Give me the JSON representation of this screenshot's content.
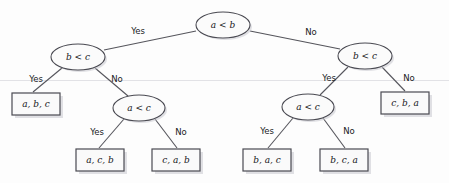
{
  "diagram": {
    "type": "decision-tree",
    "canvas": {
      "width": 449,
      "height": 183
    },
    "background_color": "#fdfdfd",
    "node_fill_color": "#fbfbfb",
    "node_stroke_color": "#4a4a52",
    "leaf_fill_color": "#fafafa",
    "edge_color": "#55555c",
    "text_color": "#17171a"
  },
  "nodes": {
    "root": {
      "label": "a < b",
      "cx": 223,
      "cy": 25,
      "rx": 27,
      "ry": 13
    },
    "left_bc": {
      "label": "b < c",
      "cx": 78,
      "cy": 57,
      "rx": 27,
      "ry": 13
    },
    "right_bc": {
      "label": "b < c",
      "cx": 365,
      "cy": 56,
      "rx": 27,
      "ry": 13
    },
    "left_ac": {
      "label": "a < c",
      "cx": 139,
      "cy": 108,
      "rx": 26,
      "ry": 13
    },
    "right_ac": {
      "label": "a < c",
      "cx": 308,
      "cy": 107,
      "rx": 26,
      "ry": 13
    }
  },
  "leaves": [
    {
      "id": "leaf-abc",
      "label": "a, b, c",
      "x": 12,
      "y": 93,
      "w": 48,
      "h": 22
    },
    {
      "id": "leaf-acb",
      "label": "a, c, b",
      "x": 76,
      "y": 149,
      "w": 48,
      "h": 22
    },
    {
      "id": "leaf-cab",
      "label": "c, a, b",
      "x": 152,
      "y": 149,
      "w": 48,
      "h": 22
    },
    {
      "id": "leaf-bac",
      "label": "b, a, c",
      "x": 243,
      "y": 149,
      "w": 48,
      "h": 22
    },
    {
      "id": "leaf-bca",
      "label": "b, c, a",
      "x": 320,
      "y": 149,
      "w": 48,
      "h": 22
    },
    {
      "id": "leaf-cba",
      "label": "c, b, a",
      "x": 381,
      "y": 92,
      "w": 48,
      "h": 22
    }
  ],
  "edge_labels": [
    {
      "id": "root-yes",
      "text": "Yes",
      "x": 138,
      "y": 31
    },
    {
      "id": "root-no",
      "text": "No",
      "x": 311,
      "y": 32
    },
    {
      "id": "left-bc-yes",
      "text": "Yes",
      "x": 36,
      "y": 79
    },
    {
      "id": "left-bc-no",
      "text": "No",
      "x": 117,
      "y": 79
    },
    {
      "id": "right-bc-yes",
      "text": "Yes",
      "x": 329,
      "y": 78
    },
    {
      "id": "right-bc-no",
      "text": "No",
      "x": 409,
      "y": 78
    },
    {
      "id": "left-ac-yes",
      "text": "Yes",
      "x": 97,
      "y": 132
    },
    {
      "id": "left-ac-no",
      "text": "No",
      "x": 181,
      "y": 132
    },
    {
      "id": "right-ac-yes",
      "text": "Yes",
      "x": 267,
      "y": 131
    },
    {
      "id": "right-ac-no",
      "text": "No",
      "x": 349,
      "y": 131
    }
  ],
  "edges": [
    {
      "id": "root-to-left-bc",
      "from": "root",
      "to": "left_bc",
      "branch": "Yes"
    },
    {
      "id": "root-to-right-bc",
      "from": "root",
      "to": "right_bc",
      "branch": "No"
    },
    {
      "id": "left-bc-to-abc",
      "from": "left_bc",
      "to": "leaf-abc",
      "branch": "Yes"
    },
    {
      "id": "left-bc-to-left-ac",
      "from": "left_bc",
      "to": "left_ac",
      "branch": "No"
    },
    {
      "id": "left-ac-to-acb",
      "from": "left_ac",
      "to": "leaf-acb",
      "branch": "Yes"
    },
    {
      "id": "left-ac-to-cab",
      "from": "left_ac",
      "to": "leaf-cab",
      "branch": "No"
    },
    {
      "id": "right-bc-to-right-ac",
      "from": "right_bc",
      "to": "right_ac",
      "branch": "Yes"
    },
    {
      "id": "right-bc-to-cba",
      "from": "right_bc",
      "to": "leaf-cba",
      "branch": "No"
    },
    {
      "id": "right-ac-to-bac",
      "from": "right_ac",
      "to": "leaf-bac",
      "branch": "Yes"
    },
    {
      "id": "right-ac-to-bca",
      "from": "right_ac",
      "to": "leaf-bca",
      "branch": "No"
    }
  ]
}
